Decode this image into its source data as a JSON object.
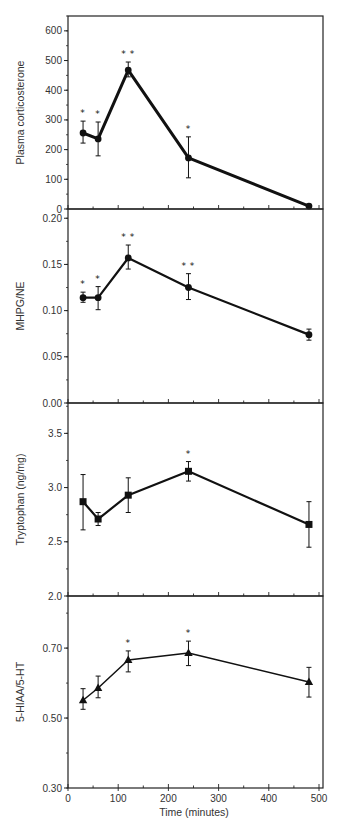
{
  "chart_data": [
    {
      "type": "line",
      "panel": 1,
      "ylabel": "Plasma corticosterone",
      "xlabel": "",
      "ylim": [
        0,
        650
      ],
      "yticks": [
        0,
        100,
        200,
        300,
        400,
        500,
        600
      ],
      "ytick_labels": [
        "0",
        "100",
        "200",
        "300",
        "400",
        "500",
        "600"
      ],
      "y_minor_step": 50,
      "marker": "circle",
      "line_width": 3,
      "x": [
        30,
        60,
        120,
        240,
        480
      ],
      "values": [
        256,
        236,
        468,
        172,
        10
      ],
      "err_upper": [
        296,
        293,
        495,
        243,
        14
      ],
      "err_lower": [
        222,
        179,
        445,
        105,
        6
      ],
      "annotations": [
        "*",
        "*",
        "**",
        "*",
        ""
      ]
    },
    {
      "type": "line",
      "panel": 2,
      "ylabel": "MHPG/NE",
      "xlabel": "",
      "ylim": [
        0,
        0.21
      ],
      "yticks": [
        0.0,
        0.05,
        0.1,
        0.15,
        0.2
      ],
      "ytick_labels": [
        "0.00",
        "0.05",
        "0.10",
        "0.15",
        "0.20"
      ],
      "y_minor_step": 0.025,
      "marker": "circle",
      "line_width": 2.2,
      "x": [
        30,
        60,
        120,
        240,
        480
      ],
      "values": [
        0.114,
        0.114,
        0.157,
        0.125,
        0.074
      ],
      "err_upper": [
        0.12,
        0.126,
        0.171,
        0.14,
        0.08
      ],
      "err_lower": [
        0.109,
        0.101,
        0.145,
        0.112,
        0.068
      ],
      "annotations": [
        "*",
        "*",
        "**",
        "**",
        ""
      ]
    },
    {
      "type": "line",
      "panel": 3,
      "ylabel": "Tryptophan (ng/mg)",
      "xlabel": "",
      "ylim": [
        2.0,
        3.78
      ],
      "yticks": [
        2.0,
        2.5,
        3.0,
        3.5
      ],
      "ytick_labels": [
        "2.0",
        "2.5",
        "3.0",
        "3.5"
      ],
      "y_minor_step": 0.25,
      "marker": "square",
      "line_width": 2.2,
      "x": [
        30,
        60,
        120,
        240,
        480
      ],
      "values": [
        2.87,
        2.71,
        2.93,
        3.15,
        2.66
      ],
      "err_upper": [
        3.12,
        2.77,
        3.09,
        3.24,
        2.87
      ],
      "err_lower": [
        2.61,
        2.65,
        2.77,
        3.06,
        2.45
      ],
      "annotations": [
        "",
        "",
        "",
        "*",
        ""
      ]
    },
    {
      "type": "line",
      "panel": 4,
      "ylabel": "5-HIAA/5-HT",
      "xlabel": "Time (minutes)",
      "ylim": [
        0.3,
        0.849
      ],
      "yticks": [
        0.3,
        0.5,
        0.7
      ],
      "ytick_labels": [
        "0.30",
        "0.50",
        "0.70"
      ],
      "y_minor_step": 0.1,
      "marker": "triangle",
      "line_width": 1.5,
      "x": [
        30,
        60,
        120,
        240,
        480
      ],
      "values": [
        0.551,
        0.586,
        0.666,
        0.686,
        0.603
      ],
      "err_upper": [
        0.584,
        0.62,
        0.692,
        0.72,
        0.645
      ],
      "err_lower": [
        0.525,
        0.558,
        0.632,
        0.65,
        0.56
      ],
      "annotations": [
        "",
        "",
        "*",
        "*",
        ""
      ]
    }
  ],
  "shared_x_axis": {
    "label": "Time (minutes)",
    "xlim": [
      0,
      510
    ],
    "ticks": [
      0,
      100,
      200,
      300,
      400,
      500
    ],
    "tick_labels": [
      "0",
      "100",
      "200",
      "300",
      "400",
      "500"
    ],
    "minor_step": 50
  },
  "colors": {
    "line": "#111111",
    "axis": "#222222",
    "text": "#333333",
    "background": "#ffffff"
  },
  "layout": {
    "plot_left": 68,
    "plot_right": 323,
    "x_px_per_unit": 0.502,
    "panels": [
      {
        "top": 16,
        "bottom": 209
      },
      {
        "top": 209,
        "bottom": 403
      },
      {
        "top": 403,
        "bottom": 596
      },
      {
        "top": 596,
        "bottom": 788
      }
    ]
  }
}
